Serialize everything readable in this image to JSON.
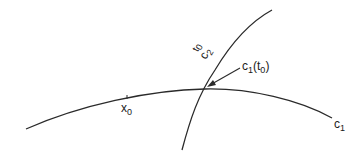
{
  "diagram": {
    "labels": {
      "x0": "x",
      "x0_sub": "0",
      "c2": "c",
      "c2_sub": "2",
      "t0": "t",
      "t0_sub": "0",
      "intersection": "c",
      "intersection_sub": "1",
      "intersection_arg": "(t",
      "intersection_arg_sub": "0",
      "intersection_close": ")",
      "c1": "c",
      "c1_sub": "1"
    },
    "colors": {
      "stroke": "#2a2a2a",
      "background": "#ffffff"
    }
  }
}
